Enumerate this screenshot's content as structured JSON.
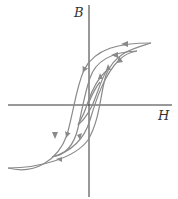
{
  "diagram": {
    "axes": {
      "x_label": "H",
      "y_label": "B"
    },
    "curves": [
      {
        "name": "outer-loop",
        "description": "major hysteresis loop saturating at upper right and lower left"
      },
      {
        "name": "middle-loop",
        "description": "intermediate hysteresis loop"
      },
      {
        "name": "inner-loop",
        "description": "small minor loop near origin"
      }
    ],
    "colors": {
      "axis": "#333333",
      "curve": "#8a8a8a"
    }
  }
}
